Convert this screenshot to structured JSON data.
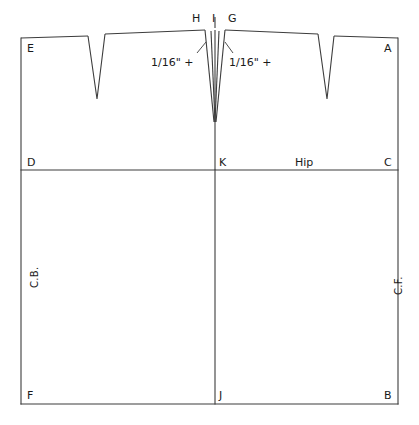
{
  "diagram": {
    "type": "sewing-pattern-draft",
    "line_color": "#3c3c3c",
    "text_color": "#1a1a1a",
    "background_color": "#ffffff",
    "canvas": {
      "width": 419,
      "height": 425
    }
  },
  "vertex_labels": {
    "e": "E",
    "a": "A",
    "h": "H",
    "i": "I",
    "g": "G",
    "d": "D",
    "k": "K",
    "c": "C",
    "f": "F",
    "j": "J",
    "b": "B"
  },
  "annotations": {
    "left_dart_amount": "1/16\" +",
    "right_dart_amount": "1/16\" +",
    "hip_line": "Hip",
    "center_back": "C.B.",
    "center_front": "C.F."
  },
  "geometry": {
    "rect": {
      "left": 21,
      "right": 398,
      "top": 38,
      "bottom": 404
    },
    "hip_line_y": 170,
    "center_x": 215,
    "top_left_peak_x": 205,
    "top_right_peak_x": 225,
    "top_peak_y": 30,
    "darts": [
      {
        "name": "back-side-dart",
        "left_x": 88,
        "right_x": 105,
        "apex_x": 97,
        "apex_y": 99
      },
      {
        "name": "center-dart-left",
        "left_x": 202,
        "right_x": 211,
        "apex_x": 214,
        "apex_y": 122
      },
      {
        "name": "center-dart-right",
        "left_x": 219,
        "right_x": 229,
        "apex_x": 216,
        "apex_y": 122
      },
      {
        "name": "front-side-dart",
        "left_x": 318,
        "right_x": 334,
        "apex_x": 327,
        "apex_y": 99
      }
    ]
  }
}
